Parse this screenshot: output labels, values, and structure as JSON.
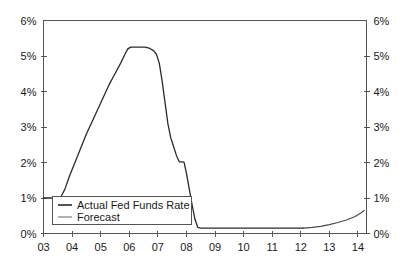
{
  "chart_data": {
    "type": "line",
    "title": "",
    "subtitle": "",
    "xlabel": "",
    "ylabel": "",
    "xlim": [
      2003.0,
      2014.3
    ],
    "ylim": [
      0,
      6
    ],
    "grid": false,
    "legend_position": "inside-bottom-left",
    "y_axis_left": {
      "ticks": [
        0,
        1,
        2,
        3,
        4,
        5,
        6
      ],
      "tick_labels": [
        "0%",
        "1%",
        "2%",
        "3%",
        "4%",
        "5%",
        "6%"
      ]
    },
    "y_axis_right": {
      "ticks": [
        0,
        1,
        2,
        3,
        4,
        5,
        6
      ],
      "tick_labels": [
        "0%",
        "1%",
        "2%",
        "3%",
        "4%",
        "5%",
        "6%"
      ]
    },
    "x_axis": {
      "ticks": [
        2003,
        2004,
        2005,
        2006,
        2007,
        2008,
        2009,
        2010,
        2011,
        2012,
        2013,
        2014
      ],
      "tick_labels": [
        "03",
        "04",
        "05",
        "06",
        "07",
        "08",
        "09",
        "10",
        "11",
        "12",
        "13",
        "14"
      ]
    },
    "series": [
      {
        "name": "Actual Fed Funds Rate",
        "color": "#2b2b2b",
        "points": [
          [
            2003.0,
            1.0
          ],
          [
            2003.3,
            1.0
          ],
          [
            2003.5,
            1.0
          ],
          [
            2003.62,
            1.05
          ],
          [
            2003.75,
            1.25
          ],
          [
            2003.9,
            1.6
          ],
          [
            2004.1,
            2.0
          ],
          [
            2004.3,
            2.4
          ],
          [
            2004.5,
            2.8
          ],
          [
            2004.7,
            3.15
          ],
          [
            2004.9,
            3.5
          ],
          [
            2005.1,
            3.85
          ],
          [
            2005.3,
            4.2
          ],
          [
            2005.5,
            4.5
          ],
          [
            2005.7,
            4.8
          ],
          [
            2005.85,
            5.05
          ],
          [
            2005.95,
            5.2
          ],
          [
            2006.05,
            5.25
          ],
          [
            2006.2,
            5.25
          ],
          [
            2006.4,
            5.25
          ],
          [
            2006.55,
            5.25
          ],
          [
            2006.7,
            5.22
          ],
          [
            2006.85,
            5.15
          ],
          [
            2006.95,
            5.05
          ],
          [
            2007.05,
            4.8
          ],
          [
            2007.15,
            4.3
          ],
          [
            2007.25,
            3.7
          ],
          [
            2007.35,
            3.1
          ],
          [
            2007.45,
            2.7
          ],
          [
            2007.55,
            2.45
          ],
          [
            2007.65,
            2.2
          ],
          [
            2007.75,
            2.02
          ],
          [
            2007.82,
            2.02
          ],
          [
            2007.88,
            2.02
          ],
          [
            2007.92,
            2.0
          ],
          [
            2008.0,
            1.7
          ],
          [
            2008.1,
            1.25
          ],
          [
            2008.2,
            0.8
          ],
          [
            2008.3,
            0.4
          ],
          [
            2008.4,
            0.17
          ],
          [
            2008.5,
            0.15
          ],
          [
            2009.0,
            0.15
          ],
          [
            2010.0,
            0.15
          ],
          [
            2011.0,
            0.15
          ],
          [
            2012.0,
            0.15
          ],
          [
            2012.1,
            0.15
          ]
        ]
      },
      {
        "name": "Forecast",
        "color": "#4a4a4a",
        "points": [
          [
            2012.1,
            0.15
          ],
          [
            2012.4,
            0.17
          ],
          [
            2012.7,
            0.2
          ],
          [
            2013.0,
            0.25
          ],
          [
            2013.3,
            0.31
          ],
          [
            2013.6,
            0.38
          ],
          [
            2013.9,
            0.48
          ],
          [
            2014.1,
            0.58
          ],
          [
            2014.22,
            0.65
          ]
        ]
      }
    ],
    "annotations": []
  },
  "legend": {
    "items": [
      {
        "label": "Actual Fed Funds Rate",
        "swatch": "solid-dark-line"
      },
      {
        "label": "Forecast",
        "swatch": "solid-gray-line"
      }
    ]
  }
}
